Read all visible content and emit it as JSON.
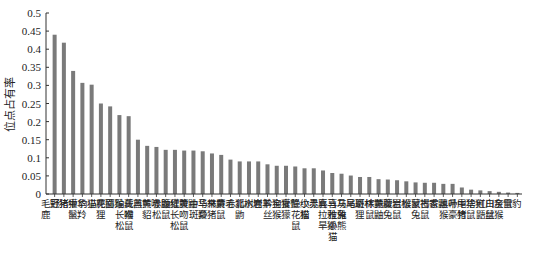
{
  "chart_data": {
    "type": "bar",
    "title": "",
    "xlabel": "",
    "ylabel": "位点占有率",
    "ylim": [
      0,
      0.5
    ],
    "yticks": [
      "0",
      "0.05",
      "0.1",
      "0.15",
      "0.2",
      "0.25",
      "0.3",
      "0.35",
      "0.4",
      "0.45",
      "0.5"
    ],
    "grid": false,
    "legend": null,
    "bar_color": "#7a7a7a",
    "categories": [
      "毛冠鹿",
      "野猪",
      "猪獾",
      "中华鬣羚",
      "豹猫",
      "小麂",
      "花面狸",
      "猕猴",
      "珀氏长吻松鼠",
      "藏酋猴",
      "黑熊",
      "黄喉貂",
      "赤腹松鼠",
      "鼬獾",
      "红腹长吻松鼠",
      "黄鼬",
      "中华斑羚",
      "马来豪猪",
      "林麝",
      "黄毛鼠",
      "赤狐",
      "北树鼩",
      "水鹿",
      "岩羊",
      "黔金丝猴",
      "狗獾",
      "食蟹獴",
      "隐纹花松鼠",
      "小灵猫",
      "赤麂",
      "喜马拉雅旱獭",
      "喜马拉雅小熊猫",
      "灰尾兔",
      "马麝",
      "斑林狸",
      "棕鼯鼠",
      "黄腹鼬",
      "藏鼠兔",
      "岩松鼠",
      "猴鼠",
      "蒙古兔",
      "褐家鼠",
      "香鼬",
      "黑叶猴",
      "帚尾豪猪",
      "中华竹鼠",
      "猞猁",
      "红白鼯鼠",
      "川金丝猴",
      "灰鼠",
      "雪豹"
    ],
    "values": [
      0.44,
      0.418,
      0.34,
      0.307,
      0.302,
      0.25,
      0.242,
      0.218,
      0.215,
      0.15,
      0.133,
      0.13,
      0.122,
      0.122,
      0.12,
      0.12,
      0.118,
      0.112,
      0.108,
      0.095,
      0.09,
      0.09,
      0.09,
      0.082,
      0.078,
      0.078,
      0.076,
      0.071,
      0.071,
      0.065,
      0.058,
      0.056,
      0.051,
      0.047,
      0.047,
      0.041,
      0.04,
      0.038,
      0.035,
      0.032,
      0.031,
      0.031,
      0.028,
      0.028,
      0.018,
      0.012,
      0.01,
      0.008,
      0.006,
      0.004,
      0.003
    ]
  }
}
